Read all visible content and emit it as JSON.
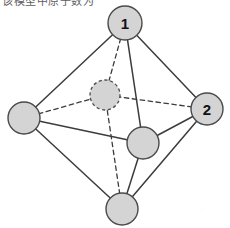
{
  "figure": {
    "caption_fragment": "该模型中原子数为",
    "background_color": "#ffffff",
    "node_fill_color": "#d4d4d4",
    "node_stroke_color": "#4a4a4a",
    "edge_color": "#3c3c3c",
    "label_color": "#111111",
    "shape_name": "octahedron",
    "view_box": "0 0 230 228"
  },
  "chart_data": {
    "type": "diagram",
    "title": "",
    "nodes": [
      {
        "id": "top",
        "label": "1",
        "cx": 125,
        "cy": 23,
        "r": 17,
        "style": "solid",
        "has_label": true
      },
      {
        "id": "right",
        "label": "2",
        "cx": 207,
        "cy": 109,
        "r": 16,
        "style": "solid",
        "has_label": true
      },
      {
        "id": "left",
        "label": "",
        "cx": 24,
        "cy": 118,
        "r": 16,
        "style": "solid",
        "has_label": false
      },
      {
        "id": "bottom",
        "label": "",
        "cx": 122,
        "cy": 209,
        "r": 16,
        "style": "solid",
        "has_label": false
      },
      {
        "id": "front",
        "label": "",
        "cx": 143,
        "cy": 143,
        "r": 16,
        "style": "solid",
        "has_label": false
      },
      {
        "id": "back",
        "label": "",
        "cx": 105,
        "cy": 95,
        "r": 15,
        "style": "dashed",
        "has_label": false
      }
    ],
    "edges": [
      {
        "from": "top",
        "to": "left",
        "style": "solid"
      },
      {
        "from": "top",
        "to": "right",
        "style": "solid"
      },
      {
        "from": "top",
        "to": "front",
        "style": "solid"
      },
      {
        "from": "top",
        "to": "back",
        "style": "dashed"
      },
      {
        "from": "bottom",
        "to": "left",
        "style": "solid"
      },
      {
        "from": "bottom",
        "to": "right",
        "style": "solid"
      },
      {
        "from": "bottom",
        "to": "front",
        "style": "solid"
      },
      {
        "from": "bottom",
        "to": "back",
        "style": "dashed"
      },
      {
        "from": "left",
        "to": "front",
        "style": "solid"
      },
      {
        "from": "left",
        "to": "back",
        "style": "dashed"
      },
      {
        "from": "right",
        "to": "front",
        "style": "solid"
      },
      {
        "from": "right",
        "to": "back",
        "style": "dashed"
      }
    ],
    "node_count": 6,
    "edge_count": 12,
    "labels": [
      "1",
      "2"
    ]
  }
}
